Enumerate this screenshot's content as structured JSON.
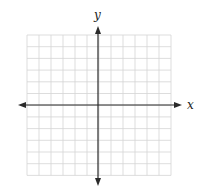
{
  "diagram": {
    "type": "coordinate-plane",
    "x_axis_label": "x",
    "y_axis_label": "y",
    "grid": {
      "columns": 12,
      "rows": 12,
      "left": 27,
      "top": 35,
      "cell_width": 12,
      "cell_height": 11.7,
      "line_color": "#d4d4d4"
    },
    "origin": {
      "x": 98,
      "y": 105
    },
    "axis_color": "#2a2a2a",
    "arrows": {
      "x_left": 18,
      "x_right": 182,
      "y_top": 26,
      "y_bottom": 186
    }
  }
}
